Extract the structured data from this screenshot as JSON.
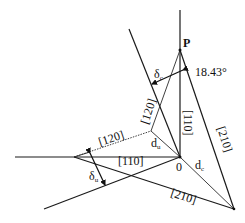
{
  "diagram": {
    "points": {
      "P": "P",
      "origin": "0"
    },
    "angle": "18.43°",
    "labels": {
      "dir_110_vertical": "[110]",
      "dir_110_horizontal": "[110]",
      "dir_120_upper": "[120]",
      "dir_120_left": "[120]",
      "dir_210_right": "[210]",
      "dir_210_bottom": "[210]"
    },
    "symbols": {
      "delta_c": "δ",
      "delta_c_sub": "c",
      "delta_u": "δ",
      "delta_u_sub": "u",
      "d_u": "d",
      "d_u_sub": "u",
      "d_c": "d",
      "d_c_sub": "c"
    },
    "colors": {
      "stroke": "#1a1a1a",
      "background": "#ffffff"
    }
  }
}
